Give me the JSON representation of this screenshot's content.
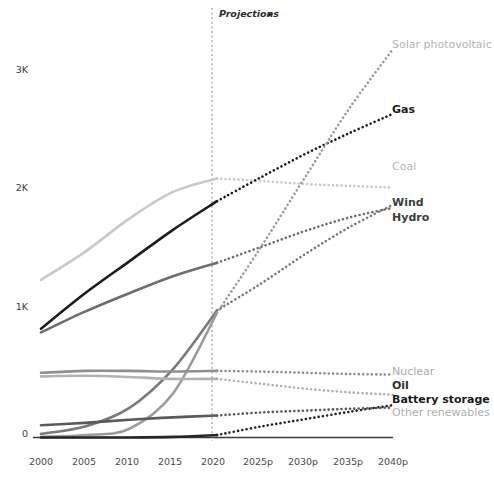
{
  "chart_data": {
    "type": "line",
    "title": "",
    "xlabel": "",
    "ylabel": "",
    "grid": false,
    "legend_position": "right-of-line-ends",
    "x": [
      2000,
      2005,
      2010,
      2015,
      2020,
      2025,
      2030,
      2035,
      2040
    ],
    "xtick_labels": [
      "2000",
      "2005",
      "2010",
      "2015",
      "2020",
      "2025p",
      "2030p",
      "2035p",
      "2040p"
    ],
    "ytick_labels": [
      "0",
      "1K",
      "2K",
      "3K"
    ],
    "ytick_values": [
      0,
      1000,
      2000,
      3000
    ],
    "ylim": [
      0,
      3250
    ],
    "xlim": [
      2000,
      2040
    ],
    "projection_marker": {
      "label": "Projections",
      "arrow_glyph": "▸",
      "start_year": 2020
    },
    "series": [
      {
        "name": "Coal",
        "label": "Coal",
        "color": "#c9c9c9",
        "label_color": "#b4b4b4",
        "label_bold": false,
        "history": [
          1290,
          1520,
          1790,
          2010,
          2120
        ],
        "projection": [
          2120,
          2100,
          2075,
          2060,
          2045
        ]
      },
      {
        "name": "Gas",
        "label": "Gas",
        "color": "#1c1c1c",
        "label_color": "#1a1a1a",
        "label_bold": true,
        "history": [
          890,
          1180,
          1440,
          1700,
          1935
        ],
        "projection": [
          1935,
          2130,
          2320,
          2490,
          2650
        ]
      },
      {
        "name": "Hydro",
        "label": "Hydro",
        "color": "#6e6e6e",
        "label_color": "#4f4f4f",
        "label_bold": true,
        "history": [
          860,
          1030,
          1180,
          1320,
          1430
        ],
        "projection": [
          1430,
          1560,
          1690,
          1800,
          1880
        ]
      },
      {
        "name": "Wind",
        "label": "Wind",
        "color": "#7a7a7a",
        "label_color": "#3d3d3d",
        "label_bold": true,
        "history": [
          30,
          90,
          240,
          560,
          1040
        ],
        "projection": [
          1040,
          1260,
          1500,
          1720,
          1905
        ]
      },
      {
        "name": "Solar photovoltaic",
        "label": "Solar photovoltaic",
        "color": "#9b9b9b",
        "label_color": "#a8a8a8",
        "label_bold": false,
        "history": [
          5,
          20,
          70,
          360,
          1020
        ],
        "projection": [
          1020,
          1560,
          2130,
          2690,
          3180
        ]
      },
      {
        "name": "Nuclear",
        "label": "Nuclear",
        "color": "#8f8f8f",
        "label_color": "#aaaaaa",
        "label_bold": false,
        "history": [
          530,
          545,
          545,
          540,
          545
        ],
        "projection": [
          545,
          540,
          530,
          520,
          515
        ]
      },
      {
        "name": "Oil",
        "label": "Oil",
        "color": "#b2b2b2",
        "label_color": "#3a3a3a",
        "label_bold": true,
        "history": [
          500,
          505,
          495,
          480,
          480
        ],
        "projection": [
          480,
          440,
          400,
          370,
          350
        ]
      },
      {
        "name": "Battery storage",
        "label": "Battery storage",
        "color": "#262626",
        "label_color": "#1a1a1a",
        "label_bold": true,
        "history": [
          0,
          0,
          0,
          5,
          20
        ],
        "projection": [
          20,
          90,
          150,
          210,
          265
        ]
      },
      {
        "name": "Other renewables",
        "label": "Other renewables",
        "color": "#5a5a5a",
        "label_color": "#b0b0b0",
        "label_bold": false,
        "history": [
          100,
          120,
          145,
          165,
          180
        ],
        "projection": [
          180,
          205,
          220,
          235,
          245
        ]
      }
    ]
  },
  "axis": {
    "ytick_0": "0",
    "ytick_1k": "1K",
    "ytick_2k": "2K",
    "ytick_3k": "3K",
    "xtick_2000": "2000",
    "xtick_2005": "2005",
    "xtick_2010": "2010",
    "xtick_2015": "2015",
    "xtick_2020": "2020",
    "xtick_2025": "2025p",
    "xtick_2030": "2030p",
    "xtick_2035": "2035p",
    "xtick_2040": "2040p"
  },
  "annotations": {
    "projections_label": "Projections",
    "projections_arrow": "▸"
  },
  "labels": {
    "solar": "Solar photovoltaic",
    "gas": "Gas",
    "coal": "Coal",
    "wind": "Wind",
    "hydro": "Hydro",
    "nuclear": "Nuclear",
    "oil": "Oil",
    "battery": "Battery storage",
    "other_renewables": "Other renewables"
  }
}
